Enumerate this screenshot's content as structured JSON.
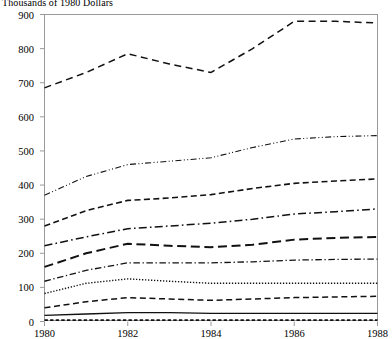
{
  "chart_data": {
    "type": "line",
    "title": "Thousands of 1980 Dollars",
    "xlabel": "",
    "ylabel": "",
    "x": [
      1980,
      1981,
      1982,
      1983,
      1984,
      1985,
      1986,
      1987,
      1988
    ],
    "xlim": [
      1980,
      1988
    ],
    "ylim": [
      0,
      900
    ],
    "xticks": [
      1980,
      1982,
      1984,
      1986,
      1988
    ],
    "yticks": [
      0,
      100,
      200,
      300,
      400,
      500,
      600,
      700,
      800,
      900
    ],
    "grid": false,
    "legend": "none",
    "series": [
      {
        "name": "series-1",
        "style": "dashed",
        "values": [
          685,
          730,
          785,
          755,
          730,
          800,
          880,
          880,
          875
        ]
      },
      {
        "name": "series-2",
        "style": "dash-dot-dot",
        "values": [
          370,
          425,
          460,
          470,
          480,
          510,
          535,
          542,
          545
        ]
      },
      {
        "name": "series-3",
        "style": "dashed-medium",
        "values": [
          280,
          325,
          355,
          362,
          372,
          390,
          405,
          412,
          418
        ]
      },
      {
        "name": "series-4",
        "style": "dash-dot",
        "values": [
          222,
          248,
          272,
          280,
          288,
          300,
          315,
          322,
          330
        ]
      },
      {
        "name": "series-5",
        "style": "long-dash",
        "values": [
          160,
          200,
          228,
          222,
          218,
          225,
          240,
          245,
          248
        ]
      },
      {
        "name": "series-6",
        "style": "dash-dot-thin",
        "values": [
          118,
          150,
          172,
          172,
          172,
          175,
          180,
          182,
          183
        ]
      },
      {
        "name": "series-7",
        "style": "dotted",
        "values": [
          82,
          112,
          125,
          118,
          112,
          112,
          112,
          112,
          112
        ]
      },
      {
        "name": "series-8",
        "style": "dashed-small",
        "values": [
          40,
          58,
          70,
          66,
          62,
          66,
          70,
          72,
          74
        ]
      },
      {
        "name": "series-9",
        "style": "solid",
        "values": [
          18,
          22,
          26,
          26,
          24,
          24,
          24,
          24,
          24
        ]
      },
      {
        "name": "series-10",
        "style": "fine-dashed",
        "values": [
          4,
          4,
          4,
          4,
          4,
          4,
          4,
          4,
          4
        ]
      }
    ]
  },
  "axes": {
    "y_tick_labels": [
      "900",
      "800",
      "700",
      "600",
      "500",
      "400",
      "300",
      "200",
      "100",
      "0"
    ],
    "x_tick_labels": [
      "1980",
      "1982",
      "1984",
      "1986",
      "1988"
    ]
  }
}
